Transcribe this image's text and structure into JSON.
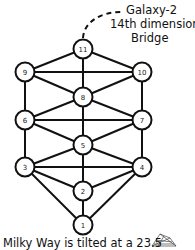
{
  "diagram": {
    "annotation": {
      "lines": [
        "Galaxy-2",
        "14th dimension",
        "Bridge"
      ]
    },
    "caption": "Milky Way is tilted at a 23.5",
    "nodes": [
      {
        "id": "1",
        "label": "1",
        "x": 83,
        "y": 225
      },
      {
        "id": "2",
        "label": "2",
        "x": 83,
        "y": 191
      },
      {
        "id": "3",
        "label": "3",
        "x": 25,
        "y": 167
      },
      {
        "id": "4",
        "label": "4",
        "x": 142,
        "y": 167
      },
      {
        "id": "5",
        "label": "5",
        "x": 83,
        "y": 145
      },
      {
        "id": "6",
        "label": "6",
        "x": 25,
        "y": 120
      },
      {
        "id": "7",
        "label": "7",
        "x": 142,
        "y": 120
      },
      {
        "id": "8",
        "label": "8",
        "x": 83,
        "y": 97
      },
      {
        "id": "9",
        "label": "9",
        "x": 25,
        "y": 72
      },
      {
        "id": "10",
        "label": "10",
        "x": 142,
        "y": 72
      },
      {
        "id": "11",
        "label": "11",
        "x": 83,
        "y": 49
      }
    ],
    "edges": [
      [
        "1",
        "2"
      ],
      [
        "1",
        "3"
      ],
      [
        "1",
        "4"
      ],
      [
        "2",
        "3"
      ],
      [
        "2",
        "4"
      ],
      [
        "2",
        "5"
      ],
      [
        "3",
        "4"
      ],
      [
        "3",
        "5"
      ],
      [
        "3",
        "6"
      ],
      [
        "4",
        "5"
      ],
      [
        "4",
        "7"
      ],
      [
        "5",
        "6"
      ],
      [
        "5",
        "7"
      ],
      [
        "5",
        "8"
      ],
      [
        "6",
        "7"
      ],
      [
        "6",
        "8"
      ],
      [
        "6",
        "9"
      ],
      [
        "7",
        "8"
      ],
      [
        "7",
        "10"
      ],
      [
        "8",
        "9"
      ],
      [
        "8",
        "10"
      ],
      [
        "8",
        "11"
      ],
      [
        "9",
        "10"
      ],
      [
        "9",
        "11"
      ],
      [
        "10",
        "11"
      ]
    ],
    "colors": {
      "stroke": "#111111",
      "fill": "#ffffff"
    }
  }
}
